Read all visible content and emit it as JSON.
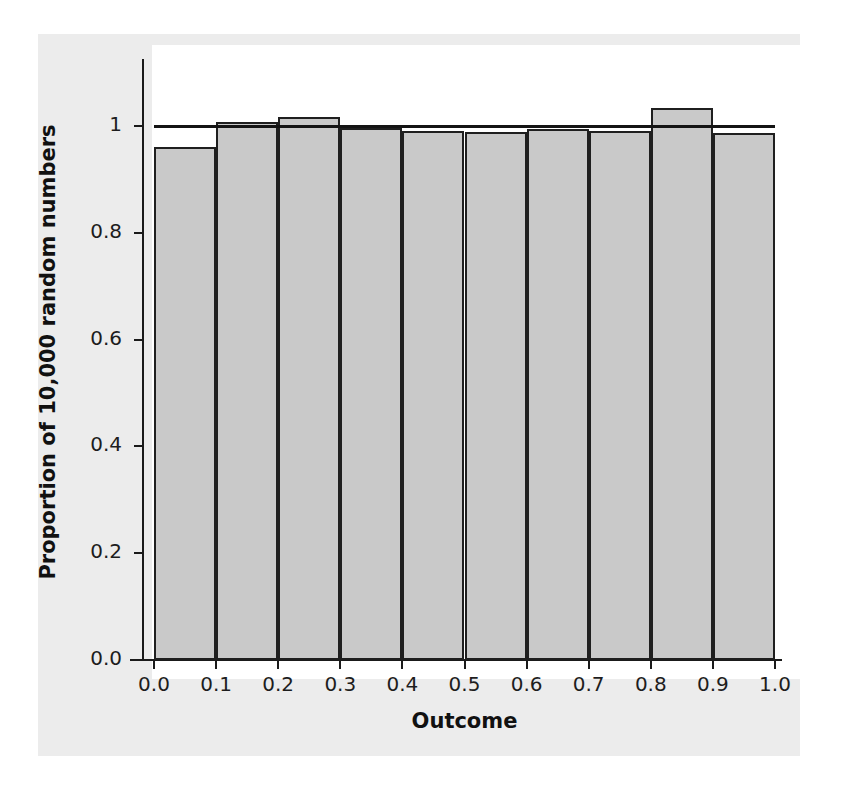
{
  "chart_data": {
    "type": "bar",
    "title": "",
    "subtitle": "",
    "xlabel": "Outcome",
    "ylabel": "Proportion of 10,000 random numbers",
    "categories": [
      "0.0-0.1",
      "0.1-0.2",
      "0.2-0.3",
      "0.3-0.4",
      "0.4-0.5",
      "0.5-0.6",
      "0.6-0.7",
      "0.7-0.8",
      "0.8-0.9",
      "0.9-1.0"
    ],
    "bin_edges": [
      0.0,
      0.1,
      0.2,
      0.3,
      0.4,
      0.5,
      0.6,
      0.7,
      0.8,
      0.9,
      1.0
    ],
    "values": [
      0.96,
      1.007,
      1.017,
      0.996,
      0.99,
      0.988,
      0.994,
      0.99,
      1.034,
      0.986
    ],
    "xlim": [
      0.0,
      1.0
    ],
    "ylim": [
      0.0,
      1.08
    ],
    "xticks": [
      "0.0",
      "0.1",
      "0.2",
      "0.3",
      "0.4",
      "0.5",
      "0.6",
      "0.7",
      "0.8",
      "0.9",
      "1.0"
    ],
    "xtick_values": [
      0.0,
      0.1,
      0.2,
      0.3,
      0.4,
      0.5,
      0.6,
      0.7,
      0.8,
      0.9,
      1.0
    ],
    "yticks": [
      "0.0",
      "0.2",
      "0.4",
      "0.6",
      "0.8",
      "1"
    ],
    "ytick_values": [
      0.0,
      0.2,
      0.4,
      0.6,
      0.8,
      1.0
    ],
    "grid": false,
    "legend": null,
    "annotations": [
      {
        "name": "expected-uniform-reference-line",
        "type": "horizontal-line",
        "y": 1.0,
        "description": "Horizontal reference line drawn across the plot at a proportion of 1.0, marking the expected value for a uniform distribution."
      }
    ],
    "series": [
      {
        "name": "Observed proportion",
        "values": [
          0.96,
          1.007,
          1.017,
          0.996,
          0.99,
          0.988,
          0.994,
          0.99,
          1.034,
          0.986
        ],
        "fill_color": "#c9c9c9",
        "edge_color": "#1f1f1f"
      }
    ],
    "colors": {
      "bar_fill": "#c9c9c9",
      "bar_edge": "#1f1f1f",
      "axis": "#1a1a1a",
      "reference_line": "#141414",
      "plot_background": "#ffffff",
      "page_background": "#ececec",
      "text": "#111111"
    }
  }
}
